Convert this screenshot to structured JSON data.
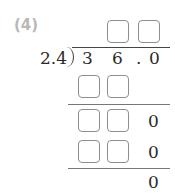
{
  "problem": {
    "label": "(4)",
    "divisor": "2.4",
    "dividend_digits": [
      "3",
      "6",
      ".",
      "0"
    ],
    "quotient_boxes": 2,
    "steps": [
      {
        "type": "boxes",
        "count": 2,
        "trailing": ""
      },
      {
        "type": "line"
      },
      {
        "type": "boxes",
        "count": 2,
        "trailing": "0"
      },
      {
        "type": "boxes",
        "count": 2,
        "trailing": "0"
      },
      {
        "type": "line"
      },
      {
        "type": "remainder",
        "value": "0"
      }
    ],
    "row3_trailing": "0",
    "row4_trailing": "0",
    "remainder": "0"
  },
  "colors": {
    "label": "#b9b9b9",
    "box_border": "#8e8e8e",
    "text": "#2a2a2a",
    "line": "#777777"
  }
}
